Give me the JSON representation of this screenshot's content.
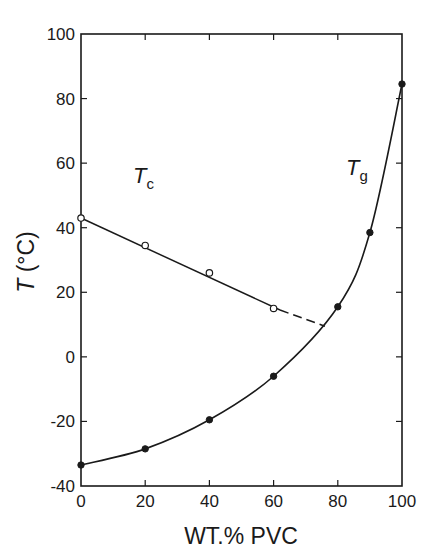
{
  "chart_data": {
    "type": "line",
    "title": "",
    "xlabel": "WT.% PVC",
    "ylabel_symbol": "T",
    "ylabel_unit": "(°C)",
    "xlim": [
      0,
      100
    ],
    "ylim": [
      -40,
      100
    ],
    "xticks": [
      0,
      20,
      40,
      60,
      80,
      100
    ],
    "yticks": [
      -40,
      -20,
      0,
      20,
      40,
      60,
      80,
      100
    ],
    "grid": false,
    "legend": "none (inline curve labels)",
    "series": [
      {
        "name": "Tc",
        "label_main": "T",
        "label_sub": "c",
        "marker": "open-circle",
        "x": [
          0,
          20,
          40,
          60
        ],
        "values": [
          43,
          34.5,
          26,
          15
        ],
        "fit_line": {
          "from": [
            0,
            43
          ],
          "to": [
            62,
            14.5
          ]
        },
        "dashed_extension": {
          "from": [
            62,
            14.5
          ],
          "to": [
            76,
            9.5
          ]
        }
      },
      {
        "name": "Tg",
        "label_main": "T",
        "label_sub": "g",
        "marker": "filled-circle",
        "x": [
          0,
          20,
          40,
          60,
          80,
          90,
          100
        ],
        "values": [
          -33.5,
          -28.5,
          -19.5,
          -6,
          15.5,
          38.5,
          84.5
        ]
      }
    ]
  },
  "labels": {
    "xlabel": "WT.% PVC",
    "ylabel_symbol": "T",
    "ylabel_unit": " (°C)",
    "tc_main": "T",
    "tc_sub": "c",
    "tg_main": "T",
    "tg_sub": "g"
  }
}
